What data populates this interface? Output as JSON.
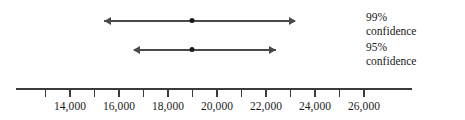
{
  "chart_data": {
    "type": "line",
    "title": "",
    "xlabel": "",
    "ylabel": "",
    "xlim": [
      12500,
      26700
    ],
    "grid": false,
    "legend_position": "right",
    "tick_labels": [
      "14,000",
      "16,000",
      "18,000",
      "20,000",
      "22,000",
      "24,000",
      "26,000"
    ],
    "tick_values": [
      14000,
      16000,
      18000,
      20000,
      22000,
      24000,
      26000
    ],
    "minor_tick_values": [
      13000,
      15000,
      17000,
      19000,
      21000,
      23000,
      25000
    ],
    "series": [
      {
        "name": "99% confidence",
        "point_estimate": 19000,
        "lower": 15400,
        "upper": 23200,
        "label_line1": "99%",
        "label_line2": "confidence"
      },
      {
        "name": "95% confidence",
        "point_estimate": 19000,
        "lower": 16600,
        "upper": 22400,
        "label_line1": "95%",
        "label_line2": "confidence"
      }
    ],
    "colors": {
      "interval": "#4a4a4a",
      "point": "#1a1a1a",
      "axis": "#3a3a3a",
      "text": "#1a1a1a",
      "background": "#ffffff"
    }
  }
}
